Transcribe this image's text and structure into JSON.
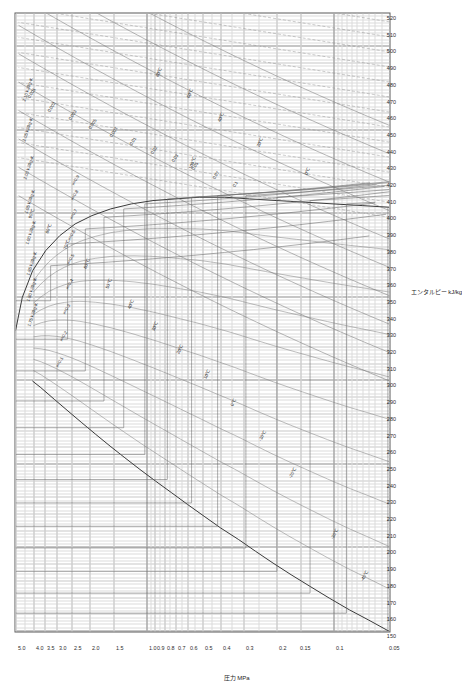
{
  "chart_data": {
    "type": "line",
    "title": "",
    "xlabel": "エンタルピー  kJ/kg",
    "ylabel": "圧力  MPa",
    "xlim": [
      150,
      520
    ],
    "ylim": [
      0.05,
      5.0
    ],
    "yscale": "log",
    "grid": true,
    "legend": "none",
    "x_ticks": [
      150,
      160,
      170,
      180,
      190,
      200,
      210,
      220,
      230,
      240,
      250,
      260,
      270,
      280,
      290,
      300,
      310,
      320,
      330,
      340,
      350,
      360,
      370,
      380,
      390,
      400,
      410,
      420,
      430,
      440,
      450,
      460,
      470,
      480,
      490,
      500,
      510,
      520
    ],
    "x_tick_labels": [
      "150",
      "160",
      "170",
      "180",
      "190",
      "200",
      "210",
      "220",
      "230",
      "240",
      "250",
      "260",
      "270",
      "280",
      "290",
      "300",
      "310",
      "320",
      "330",
      "340",
      "350",
      "360",
      "370",
      "380",
      "390",
      "400",
      "410",
      "420",
      "430",
      "440",
      "450",
      "460",
      "470",
      "480",
      "490",
      "500",
      "510",
      "520"
    ],
    "y_ticks": [
      0.05,
      0.1,
      0.15,
      0.2,
      0.3,
      0.4,
      0.5,
      0.6,
      0.7,
      0.8,
      0.9,
      1.0,
      1.5,
      2.0,
      2.5,
      3.0,
      3.5,
      4.0,
      5.0
    ],
    "y_tick_labels": [
      "0.05",
      "0.1",
      "0.15",
      "0.2",
      "0.3",
      "0.4",
      "0.5",
      "0.6",
      "0.7",
      "0.8",
      "0.9",
      "1.0",
      "1.5",
      "2.0",
      "2.5",
      "3.0",
      "3.5",
      "4.0",
      "5.0"
    ],
    "series": [
      {
        "name": "saturated-liquid-line",
        "kind": "saturation",
        "points": [
          [
            150,
            0.05
          ],
          [
            157,
            0.065
          ],
          [
            163,
            0.082
          ],
          [
            170,
            0.105
          ],
          [
            177,
            0.133
          ],
          [
            184,
            0.168
          ],
          [
            191,
            0.21
          ],
          [
            198,
            0.26
          ],
          [
            205,
            0.32
          ],
          [
            212,
            0.4
          ],
          [
            219,
            0.49
          ],
          [
            226,
            0.6
          ],
          [
            233,
            0.73
          ],
          [
            240,
            0.89
          ],
          [
            247,
            1.08
          ],
          [
            254,
            1.3
          ],
          [
            261,
            1.56
          ],
          [
            268,
            1.86
          ],
          [
            275,
            2.21
          ],
          [
            282,
            2.62
          ],
          [
            289,
            3.1
          ],
          [
            296,
            3.66
          ],
          [
            300,
            4.06
          ]
        ]
      },
      {
        "name": "saturated-vapor-line",
        "kind": "saturation",
        "points": [
          [
            404,
            0.05
          ],
          [
            405,
            0.07
          ],
          [
            406,
            0.1
          ],
          [
            407,
            0.14
          ],
          [
            408,
            0.2
          ],
          [
            409,
            0.28
          ],
          [
            410,
            0.38
          ],
          [
            410,
            0.52
          ],
          [
            409,
            0.7
          ],
          [
            408,
            0.92
          ],
          [
            406,
            1.2
          ],
          [
            403,
            1.55
          ],
          [
            399,
            1.95
          ],
          [
            394,
            2.4
          ],
          [
            387,
            2.9
          ],
          [
            378,
            3.45
          ],
          [
            366,
            4.05
          ],
          [
            350,
            4.6
          ],
          [
            330,
            5.0
          ]
        ]
      }
    ],
    "isotherms": {
      "unit": "°C",
      "labels": [
        "-40°C",
        "-30°C",
        "-20°C",
        "-10°C",
        "0°C",
        "10°C",
        "20°C",
        "30°C",
        "40°C",
        "50°C",
        "60°C",
        "70°C",
        "80°C",
        "90°C",
        "100°C"
      ]
    },
    "isentropes": {
      "unit": "kJ/kg·K",
      "labels": [
        "1.75 kJ/kg·K",
        "1.80 kJ/kg·K",
        "1.85 kJ/kg·K",
        "1.90 kJ/kg·K",
        "1.95 kJ/kg·K",
        "2.00 kJ/kg·K",
        "2.05 kJ/kg·K",
        "2.10 kJ/kg·K"
      ]
    },
    "isochores": {
      "unit": "m3/kg",
      "labels": [
        "0.001",
        "0.002",
        "0.003",
        "0.005",
        "0.007",
        "0.01",
        "0.02",
        "0.03",
        "0.05",
        "0.07",
        "0.1",
        "0.2",
        "0.3",
        "0.5"
      ]
    },
    "quality_lines": {
      "unit": "x",
      "labels": [
        "0.1",
        "0.2",
        "0.3",
        "0.4",
        "0.5",
        "0.6",
        "0.7",
        "0.8",
        "0.9"
      ]
    }
  },
  "axes": {
    "x_title": "エンタルピー  kJ/kg",
    "y_title": "圧力   MPa"
  },
  "annotations": {
    "isotherms": [
      {
        "text": "-40℃",
        "x": 181,
        "y": 0.072,
        "rot": -60
      },
      {
        "text": "-30℃",
        "x": 206,
        "y": 0.105,
        "rot": -60
      },
      {
        "text": "-20℃",
        "x": 243,
        "y": 0.175,
        "rot": -60
      },
      {
        "text": "-10℃",
        "x": 265,
        "y": 0.255,
        "rot": -62
      },
      {
        "text": "0℃",
        "x": 286,
        "y": 0.36,
        "rot": -62
      },
      {
        "text": "10℃",
        "x": 302,
        "y": 0.5,
        "rot": -64
      },
      {
        "text": "20℃",
        "x": 317,
        "y": 0.7,
        "rot": -64
      },
      {
        "text": "30℃",
        "x": 331,
        "y": 0.95,
        "rot": -66
      },
      {
        "text": "40℃",
        "x": 344,
        "y": 1.28,
        "rot": -66
      },
      {
        "text": "50℃",
        "x": 356,
        "y": 1.68,
        "rot": -68
      },
      {
        "text": "60℃",
        "x": 368,
        "y": 2.18,
        "rot": -68
      },
      {
        "text": "70℃",
        "x": 379,
        "y": 2.8,
        "rot": -70
      },
      {
        "text": "80℃",
        "x": 389,
        "y": 3.5,
        "rot": -70
      },
      {
        "text": "90℃",
        "x": 398,
        "y": 4.3,
        "rot": -72
      }
    ],
    "superheat_isotherms": [
      {
        "text": "0℃",
        "x": 424,
        "y": 0.145,
        "rot": -66
      },
      {
        "text": "20℃",
        "x": 441,
        "y": 0.26,
        "rot": -66
      },
      {
        "text": "40℃",
        "x": 456,
        "y": 0.42,
        "rot": -66
      },
      {
        "text": "60℃",
        "x": 470,
        "y": 0.62,
        "rot": -66
      },
      {
        "text": "80℃",
        "x": 483,
        "y": 0.9,
        "rot": -66
      },
      {
        "text": "100℃",
        "x": 428,
        "y": 0.6,
        "rot": -66
      }
    ],
    "isochores": [
      {
        "text": "0.001",
        "x": 470,
        "y": 4.35,
        "rot": -58
      },
      {
        "text": "0.002",
        "x": 462,
        "y": 3.4,
        "rot": -58
      },
      {
        "text": "0.003",
        "x": 457,
        "y": 2.65,
        "rot": -58
      },
      {
        "text": "0.005",
        "x": 452,
        "y": 2.05,
        "rot": -58
      },
      {
        "text": "0.007",
        "x": 447,
        "y": 1.6,
        "rot": -58
      },
      {
        "text": "0.01",
        "x": 442,
        "y": 1.24,
        "rot": -58
      },
      {
        "text": "0.02",
        "x": 437,
        "y": 0.96,
        "rot": -58
      },
      {
        "text": "0.03",
        "x": 432,
        "y": 0.74,
        "rot": -58
      },
      {
        "text": "0.05",
        "x": 427,
        "y": 0.58,
        "rot": -58
      },
      {
        "text": "0.07",
        "x": 422,
        "y": 0.45,
        "rot": -58
      },
      {
        "text": "0.1",
        "x": 417,
        "y": 0.35,
        "rot": -58
      }
    ],
    "isentropes": [
      {
        "text": "1.75 kJ/kg·K",
        "x": 333,
        "y": 4.35,
        "rot": -72
      },
      {
        "text": "1.80 kJ/kg·K",
        "x": 348,
        "y": 4.4,
        "rot": -72
      },
      {
        "text": "1.85 kJ/kg·K",
        "x": 364,
        "y": 4.45,
        "rot": -72
      },
      {
        "text": "1.90 kJ/kg·K",
        "x": 382,
        "y": 4.5,
        "rot": -72
      },
      {
        "text": "1.95 kJ/kg·K",
        "x": 401,
        "y": 4.55,
        "rot": -72
      },
      {
        "text": "2.00 kJ/kg·K",
        "x": 421,
        "y": 4.6,
        "rot": -72
      },
      {
        "text": "2.05 kJ/kg·K",
        "x": 444,
        "y": 4.62,
        "rot": -72
      },
      {
        "text": "2.10 kJ/kg·K",
        "x": 468,
        "y": 4.64,
        "rot": -72
      }
    ],
    "quality": [
      {
        "text": "x=0.1",
        "x": 309,
        "y": 3.1,
        "rot": -60
      },
      {
        "text": "x=0.2",
        "x": 325,
        "y": 2.95,
        "rot": -60
      },
      {
        "text": "x=0.3",
        "x": 341,
        "y": 2.85,
        "rot": -60
      },
      {
        "text": "x=0.4",
        "x": 356,
        "y": 2.75,
        "rot": -60
      },
      {
        "text": "x=0.5",
        "x": 371,
        "y": 2.7,
        "rot": -60
      },
      {
        "text": "x=0.6",
        "x": 385,
        "y": 2.66,
        "rot": -60
      },
      {
        "text": "x=0.7",
        "x": 398,
        "y": 2.62,
        "rot": -60
      },
      {
        "text": "x=0.8",
        "x": 409,
        "y": 2.58,
        "rot": -60
      },
      {
        "text": "x=0.9",
        "x": 418,
        "y": 2.54,
        "rot": -60
      }
    ]
  }
}
